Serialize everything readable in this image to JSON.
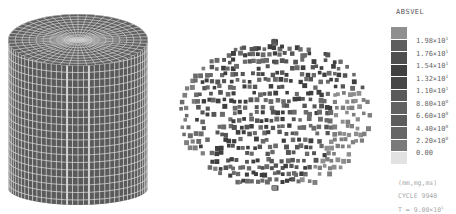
{
  "legend": {
    "title": "ABSVEL",
    "swatch_colors": [
      "#8f8f8f",
      "#5e5e5e",
      "#4e4e4e",
      "#404040",
      "#474747",
      "#5a5a5a",
      "#616161",
      "#5c5c5c",
      "#666666",
      "#7a7a7a",
      "#e2e2e2"
    ],
    "labels": [
      {
        "mantissa": "1.98",
        "exp": "1"
      },
      {
        "mantissa": "1.76",
        "exp": "1"
      },
      {
        "mantissa": "1.54",
        "exp": "1"
      },
      {
        "mantissa": "1.32",
        "exp": "1"
      },
      {
        "mantissa": "1.10",
        "exp": "1"
      },
      {
        "mantissa": "8.80",
        "exp": "0"
      },
      {
        "mantissa": "6.60",
        "exp": "0"
      },
      {
        "mantissa": "4.40",
        "exp": "0"
      },
      {
        "mantissa": "2.20",
        "exp": "0"
      },
      {
        "mantissa": "0.00",
        "exp": ""
      }
    ],
    "units": "(mm,mg,ms)",
    "cycle": "CYCLE 9940",
    "time_prefix": "T = 9.00×10",
    "time_exp": "1"
  },
  "figures": {
    "left": {
      "label": "cylinder-mesh-undeformed",
      "fill": "#5a5a5a",
      "grid": "#d8d8d8"
    },
    "right": {
      "label": "deformed-shell-velocity-plot",
      "colors": [
        "#3e3e3e",
        "#555555",
        "#6a6a6a",
        "#7e7e7e",
        "#8e8e8e"
      ]
    }
  }
}
